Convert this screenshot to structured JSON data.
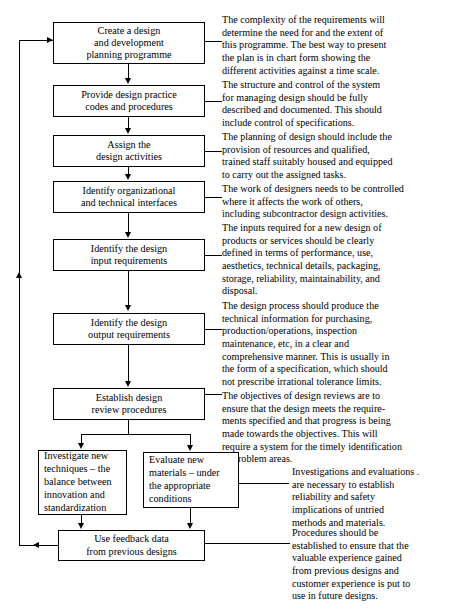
{
  "diagram": {
    "colors": {
      "ink": "#000000",
      "paper": "#ffffff"
    },
    "nodes": [
      {
        "id": "plan",
        "label": "Create a design\nand development\nplanning programme"
      },
      {
        "id": "practice",
        "label": "Provide design practice\ncodes and procedures"
      },
      {
        "id": "assign",
        "label": "Assign the\ndesign activities"
      },
      {
        "id": "interfaces",
        "label": "Identify organizational\nand technical interfaces"
      },
      {
        "id": "inputs",
        "label": "Identify the design\ninput requirements"
      },
      {
        "id": "outputs",
        "label": "Identify the design\noutput requirements"
      },
      {
        "id": "review",
        "label": "Establish design\nreview procedures"
      },
      {
        "id": "investigate",
        "label": "Investigate new\ntechniques –  the\nbalance between\ninnovation and\nstandardization"
      },
      {
        "id": "evaluate",
        "label": "Evaluate new\nmaterials – under\nthe appropriate\nconditions"
      },
      {
        "id": "feedback",
        "label": "Use feedback data\nfrom previous designs"
      }
    ],
    "notes": [
      {
        "id": "note-plan",
        "text": "The complexity of the requirements will\ndetermine the need for and the extent of\nthis programme.  The best way to present\nthe plan is in chart form showing the\ndifferent activities against a time scale."
      },
      {
        "id": "note-practice",
        "text": "The structure and control of the system\nfor managing design should be fully\ndescribed and documented.  This should\ninclude control of specifications."
      },
      {
        "id": "note-assign",
        "text": "The planning of design should include the\nprovision of resources and qualified,\ntrained staff suitably housed and equipped\nto carry out the assigned tasks."
      },
      {
        "id": "note-interfaces",
        "text": "The work of designers needs to be controlled\nwhere it affects the work of others,\nincluding subcontractor design activities."
      },
      {
        "id": "note-inputs",
        "text": "The inputs required for a new design of\nproducts or services should be clearly\ndefined in terms of performance, use,\naesthetics, technical details, packaging,\nstorage, reliability, maintainability, and\ndisposal."
      },
      {
        "id": "note-outputs",
        "text": "The design process should produce the\ntechnical information for purchasing,\nproduction/operations, inspection\nmaintenance, etc, in a clear and\ncomprehensive manner.  This is usually in\nthe form of a specification, which should\nnot prescribe irrational tolerance limits."
      },
      {
        "id": "note-review",
        "text": "The objectives of design reviews are to\nensure that the design meets the require-\nments specified and that progress is being\nmade towards the objectives.  This will\nrequire a system for the timely identification\n    of problem areas."
      },
      {
        "id": "note-evaluate",
        "text": "Investigations and evaluations .\nare necessary to establish\nreliability and safety\nimplications of untried\nmethods and materials."
      },
      {
        "id": "note-feedback",
        "text": "Procedures should be\nestablished to ensure that the\nvaluable experience gained\nfrom previous designs and\ncustomer experience is put to\nuse in future designs."
      }
    ]
  }
}
